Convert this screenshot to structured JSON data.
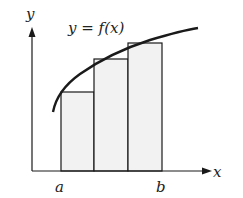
{
  "diagram": {
    "type": "riemann-sum-left",
    "curve_label": "y = f(x)",
    "x_axis_label": "x",
    "y_axis_label": "y",
    "interval_start_label": "a",
    "interval_end_label": "b",
    "rectangle_count": 3,
    "colors": {
      "stroke": "#1a1a1a",
      "rect_fill": "#f2f2f2",
      "background": "#ffffff"
    }
  }
}
